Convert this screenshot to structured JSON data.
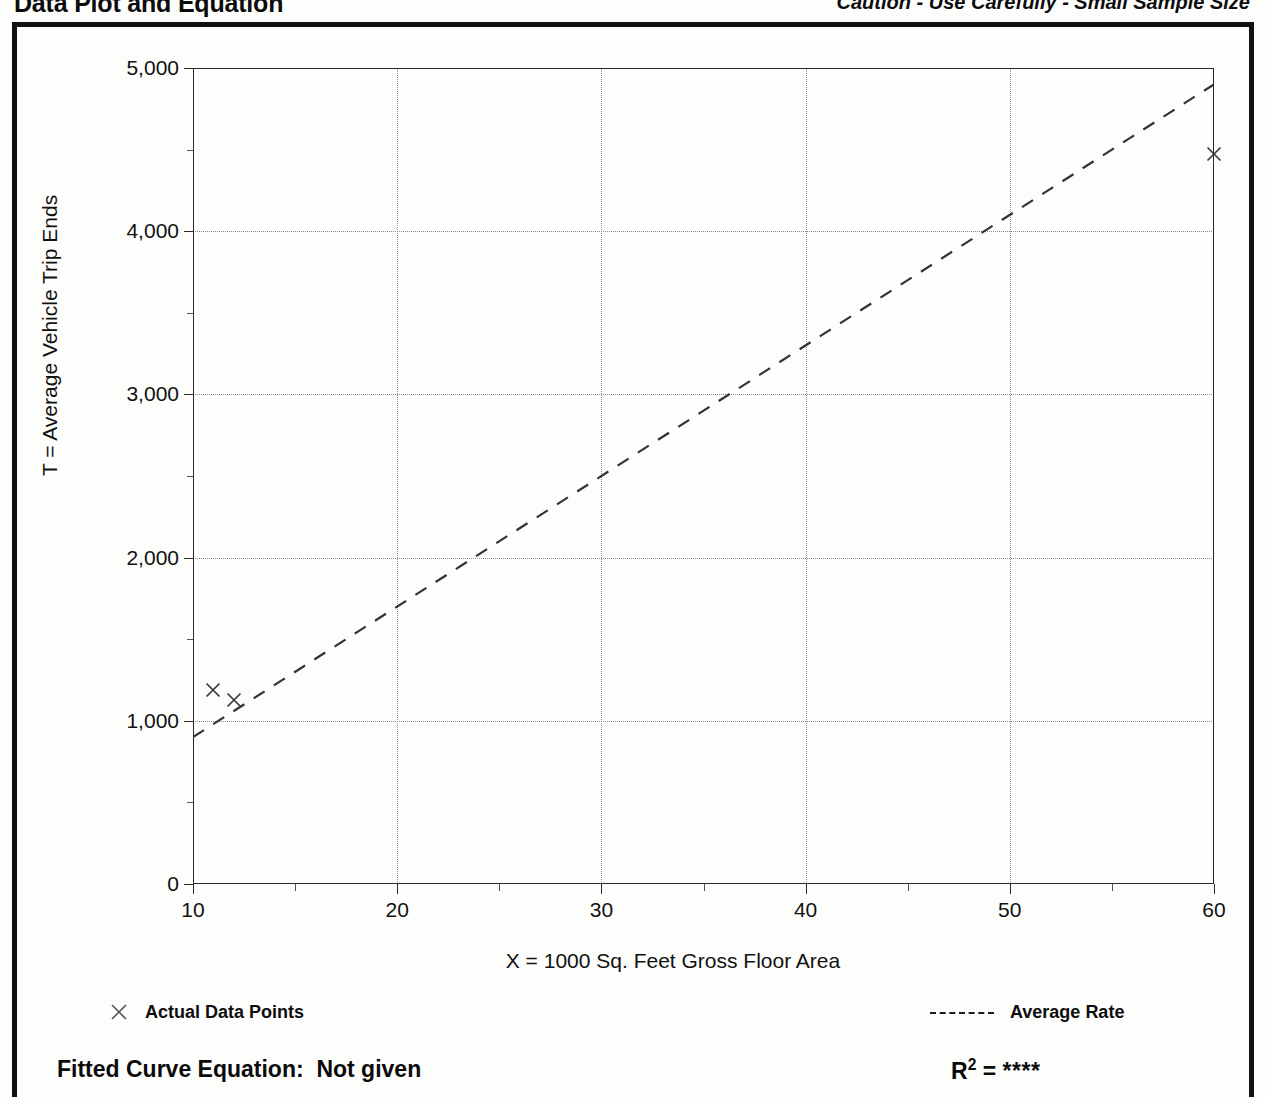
{
  "header": {
    "title": "Data Plot and Equation",
    "caution": "Caution - Use Carefully - Small Sample Size"
  },
  "legend": {
    "data_points_label": "Actual Data Points",
    "average_rate_label": "Average Rate",
    "marker_glyph": "x-marker-icon",
    "line_style": "dashed"
  },
  "footer": {
    "equation_label": "Fitted Curve Equation:",
    "equation_value": "Not given",
    "r_label": "R",
    "r_exponent": "2",
    "r_equals": "=",
    "r_value": "****"
  },
  "chart_data": {
    "type": "scatter",
    "title": "Data Plot and Equation",
    "xlabel": "X = 1000 Sq. Feet Gross Floor Area",
    "ylabel": "T = Average Vehicle Trip Ends",
    "xlim": [
      10,
      60
    ],
    "ylim": [
      0,
      5000
    ],
    "xticks": [
      10,
      20,
      30,
      40,
      50,
      60
    ],
    "xtick_labels": [
      "10",
      "20",
      "30",
      "40",
      "50",
      "60"
    ],
    "xminor_ticks": [
      15,
      25,
      35,
      45,
      55
    ],
    "yticks": [
      0,
      1000,
      2000,
      3000,
      4000,
      5000
    ],
    "ytick_labels": [
      "0",
      "1,000",
      "2,000",
      "3,000",
      "4,000",
      "5,000"
    ],
    "yminor_ticks": [
      500,
      1500,
      2500,
      3500,
      4500
    ],
    "grid": true,
    "legend_position": "below-plot",
    "series": [
      {
        "name": "Actual Data Points",
        "type": "scatter",
        "marker": "x",
        "points": [
          {
            "x": 11,
            "y": 1190
          },
          {
            "x": 12,
            "y": 1130
          },
          {
            "x": 60,
            "y": 4470
          }
        ]
      },
      {
        "name": "Average Rate",
        "type": "line",
        "style": "dashed",
        "points": [
          {
            "x": 10,
            "y": 900
          },
          {
            "x": 60,
            "y": 4900
          }
        ]
      }
    ]
  }
}
